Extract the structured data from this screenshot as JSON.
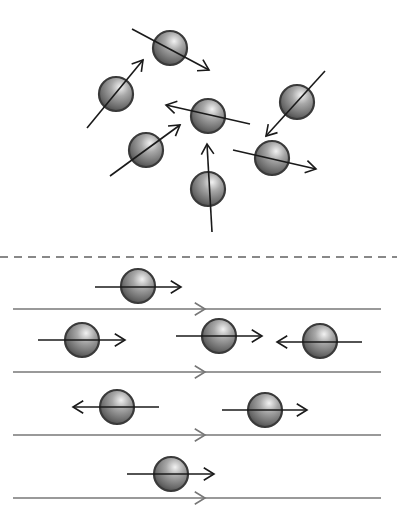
{
  "diagram": {
    "colors": {
      "arrow": "#1a1a1a",
      "flow_line": "#777777",
      "dashed_divider": "#888888",
      "ball_dark": "#3a3a3a",
      "ball_light": "#e0e0e0"
    },
    "top_section": {
      "particles": [
        {
          "cx": 170,
          "cy": 48,
          "x1": 132,
          "y1": 29,
          "x2": 209,
          "y2": 70
        },
        {
          "cx": 116,
          "cy": 94,
          "x1": 87,
          "y1": 128,
          "x2": 143,
          "y2": 60
        },
        {
          "cx": 208,
          "cy": 116,
          "x1": 250,
          "y1": 124,
          "x2": 166,
          "y2": 105
        },
        {
          "cx": 297,
          "cy": 102,
          "x1": 325,
          "y1": 71,
          "x2": 266,
          "y2": 136
        },
        {
          "cx": 146,
          "cy": 150,
          "x1": 110,
          "y1": 176,
          "x2": 180,
          "y2": 125
        },
        {
          "cx": 272,
          "cy": 158,
          "x1": 233,
          "y1": 150,
          "x2": 316,
          "y2": 169
        },
        {
          "cx": 208,
          "cy": 189,
          "x1": 212,
          "y1": 232,
          "x2": 207,
          "y2": 144
        }
      ]
    },
    "divider": {
      "y": 257
    },
    "bottom_section": {
      "flow_lines": [
        {
          "y": 309,
          "x1": 13,
          "x2": 381,
          "chevron_x": 205
        },
        {
          "y": 372,
          "x1": 13,
          "x2": 381,
          "chevron_x": 205
        },
        {
          "y": 435,
          "x1": 13,
          "x2": 381,
          "chevron_x": 205
        },
        {
          "y": 498,
          "x1": 13,
          "x2": 381,
          "chevron_x": 205
        }
      ],
      "particles": [
        {
          "cx": 138,
          "cy": 286,
          "x1": 95,
          "y1": 287,
          "x2": 181,
          "y2": 287
        },
        {
          "cx": 82,
          "cy": 340,
          "x1": 38,
          "y1": 340,
          "x2": 125,
          "y2": 340
        },
        {
          "cx": 219,
          "cy": 336,
          "x1": 176,
          "y1": 336,
          "x2": 262,
          "y2": 336
        },
        {
          "cx": 320,
          "cy": 341,
          "x1": 362,
          "y1": 342,
          "x2": 277,
          "y2": 342
        },
        {
          "cx": 117,
          "cy": 407,
          "x1": 159,
          "y1": 407,
          "x2": 73,
          "y2": 407
        },
        {
          "cx": 265,
          "cy": 410,
          "x1": 222,
          "y1": 410,
          "x2": 307,
          "y2": 410
        },
        {
          "cx": 171,
          "cy": 474,
          "x1": 127,
          "y1": 474,
          "x2": 214,
          "y2": 474
        }
      ]
    }
  }
}
